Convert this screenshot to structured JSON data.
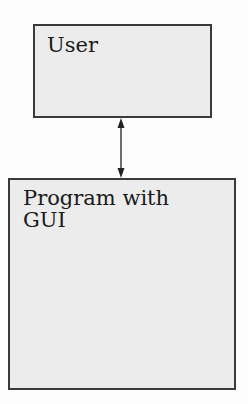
{
  "diagram": {
    "nodes": [
      {
        "id": "user",
        "label": "User"
      },
      {
        "id": "program",
        "label_line1": "Program with",
        "label_line2": "GUI"
      }
    ],
    "edges": [
      {
        "from": "user",
        "to": "program",
        "type": "bidirectional-arrow"
      }
    ]
  }
}
